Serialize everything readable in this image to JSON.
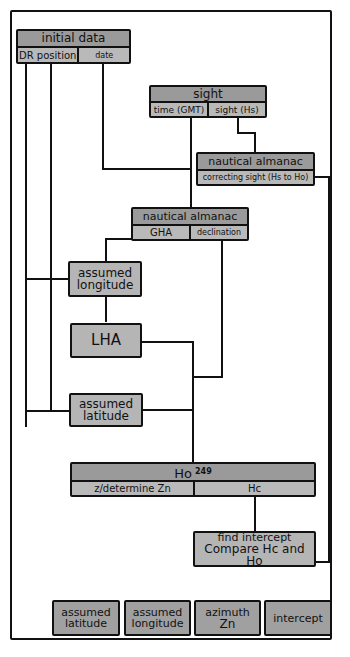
{
  "diagram": {
    "colors": {
      "header_fill": "#9a9a9a",
      "cell_fill": "#b9b9b9",
      "stroke": "#111111",
      "background": "#ffffff"
    },
    "nodes": {
      "initial_data": {
        "title": "initial data",
        "cells": [
          "DR position",
          "date"
        ]
      },
      "sight": {
        "title": "sight",
        "cells": [
          "time (GMT)",
          "sight (Hs)"
        ]
      },
      "almanac_correction": {
        "title": "nautical almanac",
        "cells": [
          "correcting sight (Hs to Ho)"
        ]
      },
      "almanac_gha": {
        "title": "nautical almanac",
        "cells": [
          "GHA",
          "declination"
        ]
      },
      "assumed_longitude": {
        "label": "assumed longitude"
      },
      "lha": {
        "label": "LHA"
      },
      "assumed_latitude": {
        "label": "assumed latitude"
      },
      "ho_table": {
        "title": "Ho",
        "title_sup": "249",
        "cells": [
          "z/determine Zn",
          "Hc"
        ]
      },
      "find_intercept": {
        "line1": "find intercept",
        "line2": "Compare Hc and Ho"
      }
    },
    "results": [
      {
        "line1": "assumed",
        "line2": "latitude"
      },
      {
        "line1": "assumed",
        "line2": "longitude"
      },
      {
        "line1": "azimuth",
        "line2": "Zn"
      },
      {
        "line1": "intercept",
        "line2": ""
      }
    ],
    "edges": [
      [
        "initial_data.DR position",
        "assumed_longitude"
      ],
      [
        "initial_data.DR position",
        "assumed_latitude"
      ],
      [
        "initial_data.date",
        "almanac_gha"
      ],
      [
        "sight.time (GMT)",
        "almanac_gha"
      ],
      [
        "sight.sight (Hs)",
        "almanac_correction"
      ],
      [
        "almanac_correction",
        "find_intercept"
      ],
      [
        "almanac_gha.GHA",
        "assumed_longitude"
      ],
      [
        "assumed_longitude",
        "lha"
      ],
      [
        "almanac_gha.declination",
        "ho_table"
      ],
      [
        "lha",
        "ho_table"
      ],
      [
        "assumed_latitude",
        "ho_table"
      ],
      [
        "ho_table.Hc",
        "find_intercept"
      ]
    ]
  }
}
